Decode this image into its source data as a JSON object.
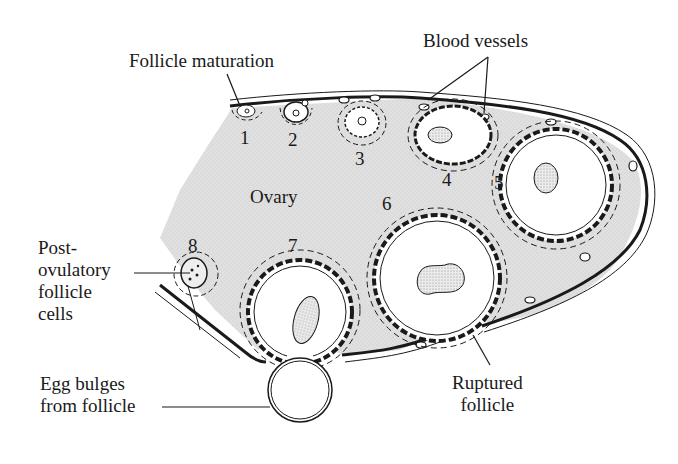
{
  "diagram": {
    "colors": {
      "ovary_fill": "#dedede",
      "line": "#1a1a1a",
      "background": "#ffffff",
      "nucleus_fill": "#e8e8e8"
    },
    "labels": {
      "follicle_maturation": "Follicle maturation",
      "blood_vessels": "Blood vessels",
      "ovary": "Ovary",
      "post_ovulatory": "Post-\novulatory\nfollicle\ncells",
      "egg_bulges": "Egg bulges\nfrom follicle",
      "ruptured_follicle": "Ruptured\nfollicle"
    },
    "stage_numbers": [
      "1",
      "2",
      "3",
      "4",
      "5",
      "6",
      "7",
      "8"
    ]
  }
}
